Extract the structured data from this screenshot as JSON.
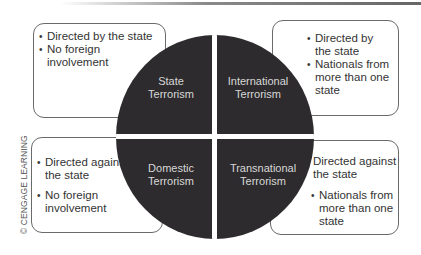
{
  "diagram": {
    "center_quadrants": [
      {
        "id": "state",
        "line1": "State",
        "line2": "Terrorism"
      },
      {
        "id": "international",
        "line1": "International",
        "line2": "Terrorism"
      },
      {
        "id": "domestic",
        "line1": "Domestic",
        "line2": "Terrorism"
      },
      {
        "id": "transnational",
        "line1": "Transnational",
        "line2": "Terrorism"
      }
    ],
    "boxes": {
      "state": [
        "Directed by the state",
        "No foreign involvement"
      ],
      "international": [
        "Directed by the state",
        "Nationals from more than one state"
      ],
      "domestic": [
        "Directed against the state",
        "No foreign involvement"
      ],
      "transnational": [
        "Directed against the state",
        "Nationals from more than one state"
      ]
    },
    "colors": {
      "circle": "#2d2b2d",
      "circle_text": "#d8d8d8",
      "box_border": "#6a6a6a"
    }
  },
  "credit": "© CENGAGE LEARNING"
}
